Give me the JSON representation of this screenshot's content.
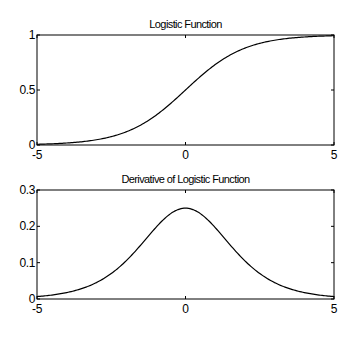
{
  "chart_data": [
    {
      "type": "line",
      "title": "Logistic Function",
      "xlabel": "",
      "ylabel": "",
      "xlim": [
        -5,
        5
      ],
      "ylim": [
        0,
        1
      ],
      "grid": false,
      "xticks": [
        -5,
        0,
        5
      ],
      "yticks": [
        0,
        0.5,
        1
      ],
      "xtick_labels": [
        "-5",
        "0",
        "5"
      ],
      "ytick_labels": [
        "0",
        "0.5",
        "1"
      ],
      "series": [
        {
          "name": "logistic",
          "x": [
            -5,
            -4,
            -3,
            -2,
            -1,
            0,
            1,
            2,
            3,
            4,
            5
          ],
          "values": [
            0.0067,
            0.018,
            0.047,
            0.119,
            0.269,
            0.5,
            0.731,
            0.881,
            0.953,
            0.982,
            0.9933
          ]
        }
      ],
      "box": {
        "left": 37,
        "top": 35,
        "right": 334,
        "bottom": 145
      }
    },
    {
      "type": "line",
      "title": "Derivative of Logistic Function",
      "xlabel": "",
      "ylabel": "",
      "xlim": [
        -5,
        5
      ],
      "ylim": [
        0,
        0.3
      ],
      "grid": false,
      "xticks": [
        -5,
        0,
        5
      ],
      "yticks": [
        0,
        0.1,
        0.2,
        0.3
      ],
      "xtick_labels": [
        "-5",
        "0",
        "5"
      ],
      "ytick_labels": [
        "0",
        "0.1",
        "0.2",
        "0.3"
      ],
      "series": [
        {
          "name": "derivative",
          "x": [
            -5,
            -4,
            -3,
            -2,
            -1,
            0,
            1,
            2,
            3,
            4,
            5
          ],
          "values": [
            0.0066,
            0.0177,
            0.0452,
            0.105,
            0.197,
            0.25,
            0.197,
            0.105,
            0.0452,
            0.0177,
            0.0066
          ]
        }
      ],
      "box": {
        "left": 37,
        "top": 190,
        "right": 334,
        "bottom": 299
      }
    }
  ]
}
